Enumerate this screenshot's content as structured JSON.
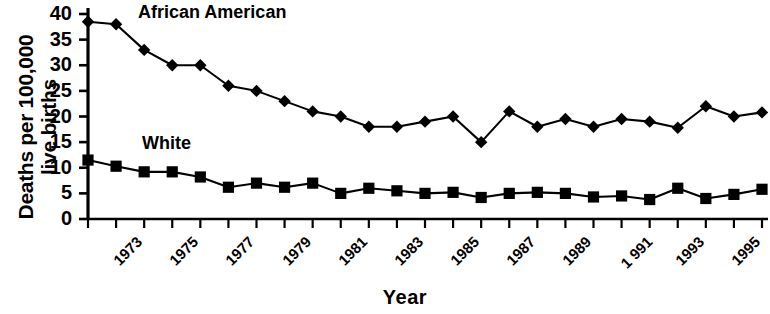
{
  "chart_data": {
    "type": "line",
    "title": "",
    "xlabel": "Year",
    "ylabel": "Deaths per 100,000 live births",
    "ylabel_lines": [
      "Deaths per 100,000",
      "live births"
    ],
    "grid": false,
    "legend_position": "inline-annotation",
    "ylim": [
      0,
      40
    ],
    "yticks": [
      0,
      5,
      10,
      15,
      20,
      25,
      30,
      35,
      40
    ],
    "ytick_labels": [
      "0",
      "5",
      "10",
      "15",
      "20",
      "25",
      "30",
      "35",
      "40"
    ],
    "x": [
      1973,
      1974,
      1975,
      1976,
      1977,
      1978,
      1979,
      1980,
      1981,
      1982,
      1983,
      1984,
      1985,
      1986,
      1987,
      1988,
      1989,
      1990,
      1991,
      1992,
      1993,
      1994,
      1995,
      1996,
      1997
    ],
    "xtick_labels": [
      "1973",
      "",
      "1975",
      "",
      "1977",
      "",
      "1979",
      "",
      "1981",
      "",
      "1983",
      "",
      "1985",
      "",
      "1987",
      "",
      "1989",
      "",
      "1 991",
      "",
      "1993",
      "",
      "1995",
      "",
      "1997"
    ],
    "series": [
      {
        "name": "African American",
        "marker": "diamond",
        "color": "#000000",
        "values": [
          38.5,
          38.0,
          33.0,
          30.0,
          30.0,
          26.0,
          25.0,
          23.0,
          21.0,
          20.0,
          18.0,
          18.0,
          19.0,
          20.0,
          15.0,
          21.0,
          18.0,
          19.5,
          18.0,
          19.5,
          19.0,
          17.8,
          22.0,
          20.0,
          20.8
        ]
      },
      {
        "name": "White",
        "marker": "square",
        "color": "#000000",
        "values": [
          11.5,
          10.3,
          9.2,
          9.2,
          8.2,
          6.2,
          7.0,
          6.2,
          7.0,
          5.0,
          6.0,
          5.5,
          5.0,
          5.2,
          4.2,
          5.0,
          5.2,
          5.0,
          4.3,
          4.5,
          3.8,
          6.0,
          4.0,
          4.8,
          5.8
        ]
      }
    ]
  },
  "labels": {
    "african_american": "African American",
    "white": "White",
    "year": "Year",
    "y_line_1": "Deaths per 100,000",
    "y_line_2": "live births"
  }
}
